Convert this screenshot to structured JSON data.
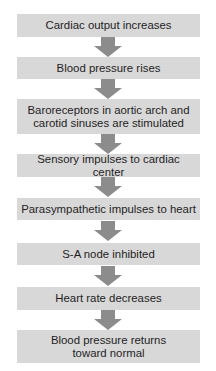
{
  "diagram": {
    "type": "flowchart",
    "direction": "top-to-bottom",
    "colors": {
      "box_fill": "#d8d8d8",
      "arrow_fill": "#8c8c8c",
      "text": "#1e1e1e",
      "background": "#ffffff"
    },
    "steps": [
      {
        "label": "Cardiac output increases"
      },
      {
        "label": "Blood pressure rises"
      },
      {
        "label": "Baroreceptors in aortic arch and\ncarotid sinuses are stimulated"
      },
      {
        "label": "Sensory impulses to cardiac center"
      },
      {
        "label": "Parasympathetic impulses to heart"
      },
      {
        "label": "S-A node inhibited"
      },
      {
        "label": "Heart rate decreases"
      },
      {
        "label": "Blood pressure returns\ntoward normal"
      }
    ],
    "arrows": [
      {
        "from": 0,
        "to": 1,
        "icon": "down-arrow-icon"
      },
      {
        "from": 1,
        "to": 2,
        "icon": "down-arrow-icon"
      },
      {
        "from": 2,
        "to": 3,
        "icon": "down-arrow-icon"
      },
      {
        "from": 3,
        "to": 4,
        "icon": "down-arrow-icon"
      },
      {
        "from": 4,
        "to": 5,
        "icon": "down-arrow-icon"
      },
      {
        "from": 5,
        "to": 6,
        "icon": "down-arrow-icon"
      },
      {
        "from": 6,
        "to": 7,
        "icon": "down-arrow-icon"
      }
    ]
  }
}
